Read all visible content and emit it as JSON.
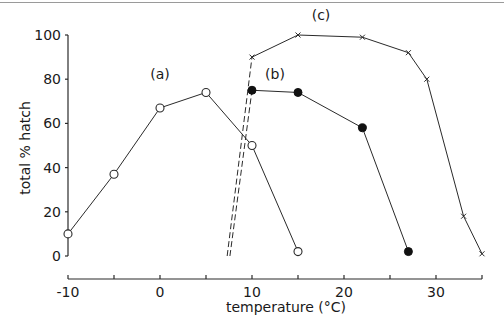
{
  "chart_data": {
    "type": "line",
    "title": "",
    "xlabel": "temperature (°C)",
    "ylabel": "total % hatch",
    "xlim": [
      -10,
      35
    ],
    "ylim": [
      0,
      100
    ],
    "x_ticks": [
      -10,
      -5,
      0,
      5,
      10,
      15,
      20,
      25,
      30,
      35
    ],
    "x_tick_labels": [
      "-10",
      "0",
      "10",
      "20",
      "30"
    ],
    "x_tick_label_values": [
      -10,
      0,
      10,
      20,
      30
    ],
    "y_ticks": [
      0,
      20,
      40,
      60,
      80,
      100
    ],
    "y_tick_labels": [
      "0",
      "20",
      "40",
      "60",
      "80",
      "100"
    ],
    "grid": false,
    "legend": "inline labels",
    "series": [
      {
        "name": "(a)",
        "marker": "open-circle",
        "line": "solid",
        "x": [
          -10,
          -5,
          0,
          5,
          10,
          15
        ],
        "y": [
          10,
          37,
          67,
          74,
          50,
          2
        ],
        "label_pos": [
          0,
          80
        ]
      },
      {
        "name": "(b)",
        "marker": "filled-circle",
        "line": "solid",
        "x": [
          10,
          15,
          22,
          27
        ],
        "y": [
          75,
          74,
          58,
          2
        ],
        "label_pos": [
          12.5,
          80
        ]
      },
      {
        "name": "(c)",
        "marker": "cross",
        "line": "solid",
        "x": [
          10,
          15,
          22,
          27,
          29,
          33,
          35
        ],
        "y": [
          90,
          100,
          99,
          92,
          80,
          18,
          1
        ],
        "label_pos": [
          17.5,
          107
        ]
      }
    ],
    "dashed_extrapolations": [
      {
        "from": [
          7.3,
          0
        ],
        "to": [
          10,
          90
        ],
        "series": "(c)"
      },
      {
        "from": [
          7.6,
          0
        ],
        "to": [
          10,
          75
        ],
        "series": "(b)"
      }
    ]
  },
  "layout": {
    "plot_left_px": 68,
    "x0_px": 160,
    "px_per_unit_x": 9.2,
    "y0_px": 256,
    "px_per_unit_y": 2.21,
    "yaxis_top": 33,
    "xaxis_y": 279
  }
}
